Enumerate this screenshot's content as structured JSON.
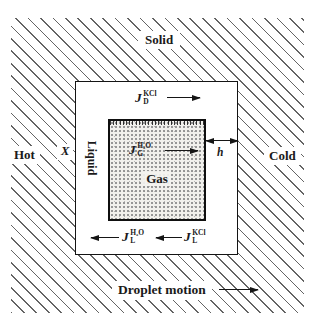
{
  "figure": {
    "region_labels": {
      "solid": "Solid",
      "liquid": "Liquid",
      "gas": "Gas"
    },
    "side_labels": {
      "hot": "Hot",
      "cold": "Cold"
    },
    "symbols": {
      "position": "X",
      "gap_width": "h"
    },
    "fluxes": {
      "solid_top": {
        "symbol": "J",
        "sub": "D",
        "sup": "KCl",
        "direction": "right"
      },
      "gas_inner": {
        "symbol": "J",
        "sub": "G",
        "sup": "H₂O",
        "direction": "right"
      },
      "liquid_bottom_left": {
        "symbol": "J",
        "sub": "L",
        "sup": "H₂O",
        "direction": "left"
      },
      "liquid_bottom_right": {
        "symbol": "J",
        "sub": "L",
        "sup": "KCl",
        "direction": "left"
      }
    },
    "caption_arrow": {
      "label": "Droplet motion",
      "direction": "right"
    },
    "colors": {
      "ink": "#1a1a1a",
      "hatch_line": "#646464",
      "stipple_dot": "#8f8f8f",
      "stipple_bg": "#f1f0ec"
    }
  }
}
